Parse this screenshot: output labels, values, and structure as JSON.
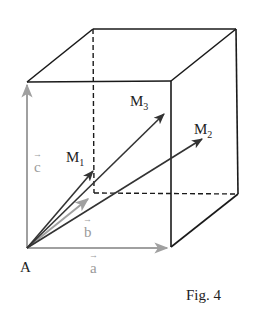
{
  "figure": {
    "caption": "Fig. 4",
    "colors": {
      "edge": "#1a1a1a",
      "basis_vector": "#a0a0a0",
      "result_vector": "#333333",
      "grey_label": "#9a9a9a",
      "dark_label": "#222222"
    },
    "labels": {
      "origin": "A",
      "a": "a",
      "b": "b",
      "c": "c",
      "m1": "M",
      "m1_sub": "1",
      "m2": "M",
      "m2_sub": "2",
      "m3": "M",
      "m3_sub": "3",
      "vec_arrow": "→"
    },
    "vertices": {
      "A": [
        27,
        248
      ],
      "front_bottom_right": [
        171,
        247
      ],
      "front_top_left": [
        27,
        82
      ],
      "front_top_right": [
        171,
        81
      ],
      "back_top_left": [
        93,
        29
      ],
      "back_top_right": [
        236,
        29
      ],
      "back_bottom_left": [
        94,
        193
      ],
      "back_bottom_right": [
        238,
        194
      ]
    },
    "vectors": {
      "a": {
        "from": [
          27,
          248
        ],
        "to": [
          167,
          248
        ]
      },
      "b": {
        "from": [
          27,
          248
        ],
        "to": [
          88,
          199
        ]
      },
      "c": {
        "from": [
          27,
          248
        ],
        "to": [
          27,
          85
        ]
      },
      "M1": {
        "from": [
          27,
          248
        ],
        "to": [
          93,
          171
        ]
      },
      "M2": {
        "from": [
          27,
          248
        ],
        "to": [
          202,
          139
        ]
      },
      "M3": {
        "from": [
          27,
          248
        ],
        "to": [
          164,
          114
        ]
      }
    }
  }
}
